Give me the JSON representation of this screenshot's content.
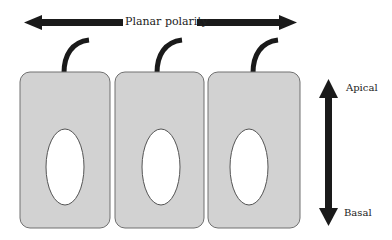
{
  "diagram": {
    "labels": {
      "planar": "Planar polarity",
      "apical": "Apical",
      "basal": "Basal"
    },
    "colors": {
      "cell_fill": "#d2d2d2",
      "cell_stroke": "#707070",
      "nucleus_fill": "#ffffff",
      "arrow": "#1a1a1a",
      "cilium": "#1a1a1a"
    },
    "cells": [
      {
        "name": "cell-1",
        "x": 20,
        "y": 72,
        "w": 90,
        "h": 156,
        "nucleus": {
          "cx": 65,
          "cy": 167,
          "rx": 19,
          "ry": 38
        }
      },
      {
        "name": "cell-2",
        "x": 115,
        "y": 72,
        "w": 89,
        "h": 156,
        "nucleus": {
          "cx": 161,
          "cy": 167,
          "rx": 19,
          "ry": 38
        }
      },
      {
        "name": "cell-3",
        "x": 208,
        "y": 72,
        "w": 92,
        "h": 156,
        "nucleus": {
          "cx": 249,
          "cy": 167,
          "rx": 19,
          "ry": 38
        }
      }
    ]
  }
}
